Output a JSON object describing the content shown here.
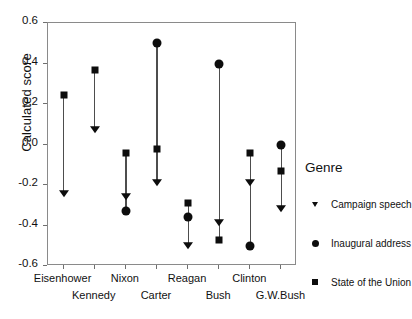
{
  "chart_data": {
    "type": "scatter",
    "title": "",
    "xlabel": "",
    "ylabel": "Calculated score",
    "ylim": [
      -0.6,
      0.6
    ],
    "yticks": [
      0.6,
      0.4,
      0.2,
      0.0,
      -0.2,
      -0.4,
      -0.6
    ],
    "ytick_labels": [
      "0.6",
      "0.4",
      "0.2",
      "0.0",
      "-0.2",
      "-0.4",
      "-0.6"
    ],
    "grid": false,
    "legend_position": "right",
    "categories": [
      "Eisenhower",
      "Kennedy",
      "Nixon",
      "Carter",
      "Reagan",
      "Bush",
      "Clinton",
      "G.W.Bush"
    ],
    "series": [
      {
        "name": "Campaign speech",
        "marker": "triangle-down",
        "values": [
          -0.245,
          0.07,
          -0.26,
          -0.19,
          -0.5,
          -0.39,
          -0.19,
          -0.32
        ]
      },
      {
        "name": "Inaugural address",
        "marker": "circle",
        "values": [
          null,
          null,
          -0.33,
          0.5,
          -0.36,
          0.4,
          -0.5,
          0.0
        ]
      },
      {
        "name": "State of the Union",
        "marker": "square",
        "values": [
          0.245,
          0.37,
          -0.04,
          -0.02,
          -0.29,
          -0.47,
          -0.04,
          -0.13
        ]
      }
    ]
  },
  "legend": {
    "title": "Genre",
    "entries": [
      {
        "label": "Campaign speech",
        "marker": "triangle-down-icon"
      },
      {
        "label": "Inaugural address",
        "marker": "circle-icon"
      },
      {
        "label": "State of the Union",
        "marker": "square-icon"
      }
    ]
  },
  "colors": {
    "marker": "#0d0d0d",
    "stem": "#4d4d4d",
    "axis": "#8a8a8a",
    "background": "#ffffff"
  }
}
